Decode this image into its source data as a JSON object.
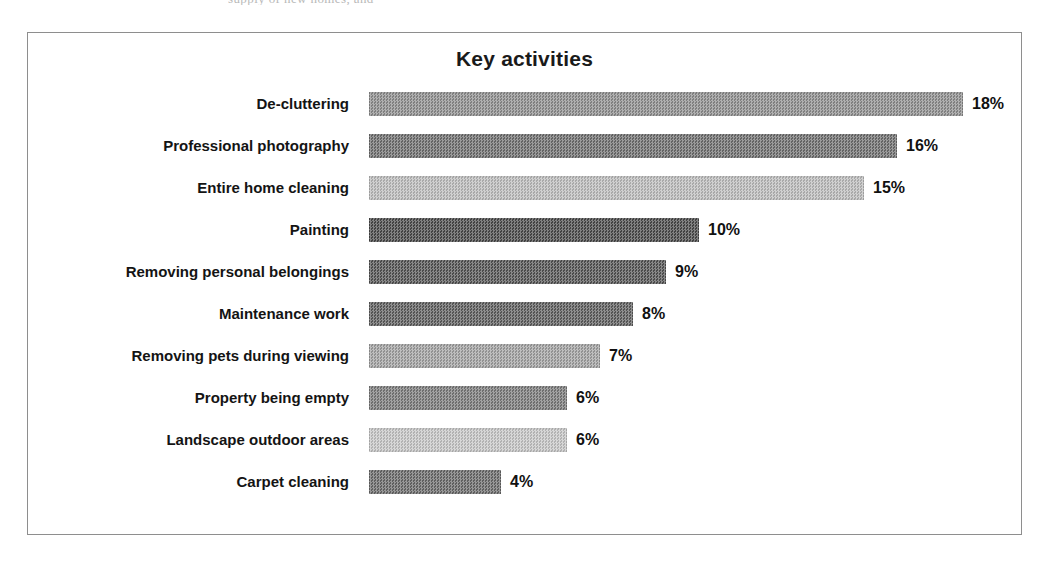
{
  "page": {
    "background_color": "#ffffff",
    "scan_fragment_text": "supply of new homes, and"
  },
  "chart_frame": {
    "border_color": "#8e8e8e",
    "background_color": "#ffffff"
  },
  "chart_data": {
    "type": "bar",
    "orientation": "horizontal",
    "title": "Key activities",
    "xlabel": "",
    "ylabel": "",
    "grid": false,
    "legend": "none",
    "xlim": [
      0,
      18
    ],
    "value_suffix": "%",
    "categories": [
      "De-cluttering",
      "Professional photography",
      "Entire home cleaning",
      "Painting",
      "Removing personal belongings",
      "Maintenance work",
      "Removing pets during viewing",
      "Property being empty",
      "Landscape outdoor areas",
      "Carpet cleaning"
    ],
    "values": [
      18,
      16,
      15,
      10,
      9,
      8,
      7,
      6,
      6,
      4
    ],
    "value_labels": [
      "18%",
      "16%",
      "15%",
      "10%",
      "9%",
      "8%",
      "7%",
      "6%",
      "6%",
      "4%"
    ],
    "bar_colors": [
      "#8e8e8e",
      "#6e6e6e",
      "#bcbcbc",
      "#4a4a4a",
      "#545454",
      "#5e5e5e",
      "#a2a2a2",
      "#7a7a7a",
      "#c6c6c6",
      "#6a6a6a"
    ]
  }
}
